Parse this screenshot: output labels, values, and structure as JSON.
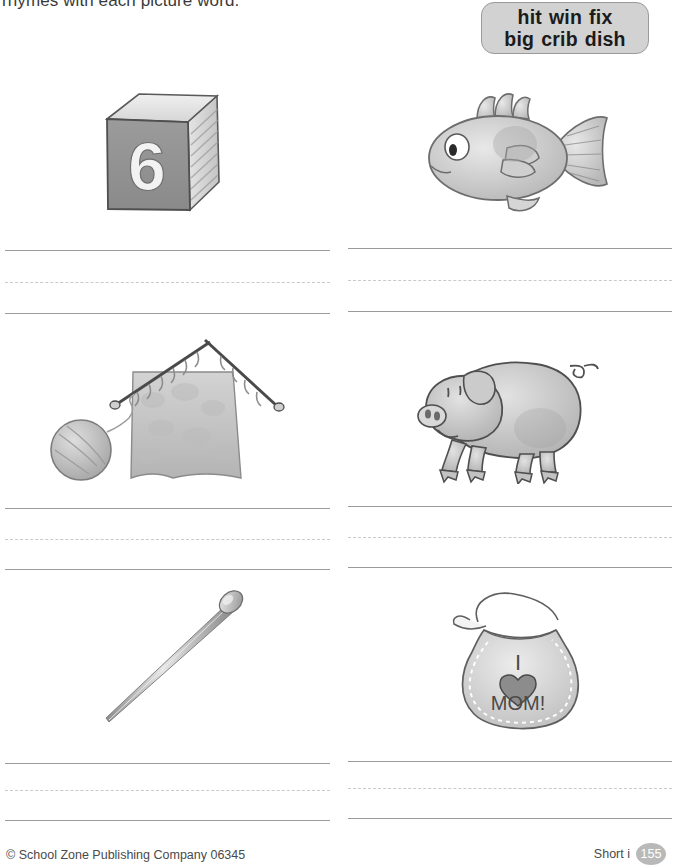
{
  "worksheet": {
    "instruction": "rhymes with each picture word.",
    "skill_label": "Short i",
    "page_number": "155",
    "copyright": "© School Zone Publishing Company  06345"
  },
  "word_box": {
    "name": "word-bank",
    "rows": [
      {
        "words": [
          "hit",
          "win",
          "fix"
        ]
      },
      {
        "words": [
          "big",
          "crib",
          "dish"
        ]
      }
    ]
  },
  "exercises": [
    {
      "id": "block-six",
      "picture": "toy-block-with-number-six",
      "answer_word": "six",
      "number_on_block": "6",
      "column": "left",
      "row": 1
    },
    {
      "id": "fish",
      "picture": "fish",
      "answer_word": "fish",
      "column": "right",
      "row": 1
    },
    {
      "id": "knitting",
      "picture": "knitting-with-yarn-ball-and-needles",
      "answer_word": "knit",
      "column": "left",
      "row": 2
    },
    {
      "id": "pig",
      "picture": "pig",
      "answer_word": "pig",
      "column": "right",
      "row": 2
    },
    {
      "id": "pin",
      "picture": "straight-pin",
      "answer_word": "pin",
      "column": "left",
      "row": 3
    },
    {
      "id": "bib",
      "picture": "baby-bib",
      "answer_word": "bib",
      "column": "right",
      "row": 3,
      "bib_text_top": "I",
      "bib_text_bottom": "MOM!"
    }
  ],
  "colors": {
    "rule_solid": "#9b9b9b",
    "rule_dashed": "#c9c9c9",
    "word_box_fill": "#d2d2d2",
    "word_box_border": "#9a9a9a",
    "badge_fill": "#b9b9b9",
    "ink": "#3a3a3a"
  }
}
